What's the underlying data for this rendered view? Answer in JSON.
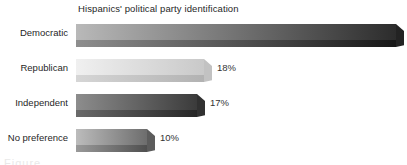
{
  "chart_data": {
    "type": "bar",
    "orientation": "horizontal",
    "title": "Hispanics' political party identification",
    "xlabel": "",
    "ylabel": "",
    "categories": [
      "Democratic",
      "Republican",
      "Independent",
      "No preference"
    ],
    "values": [
      45,
      18,
      17,
      10
    ],
    "value_labels": [
      "45%",
      "18%",
      "17%",
      "10%"
    ],
    "xlim": [
      0,
      45
    ],
    "grid": false,
    "legend": "none",
    "style": "3d-grayscale-gradient-bars",
    "bar_colors": [
      {
        "light": "#b9b9b9",
        "dark": "#2c2c2c",
        "shadow_light": "#8e8e8e",
        "shadow_dark": "#171717",
        "cap": "#232323"
      },
      {
        "light": "#f0f0f0",
        "dark": "#c9c9c9",
        "shadow_light": "#d6d6d6",
        "shadow_dark": "#b2b2b2",
        "cap": "#c2c2c2"
      },
      {
        "light": "#8d8d8d",
        "dark": "#3b3b3b",
        "shadow_light": "#6a6a6a",
        "shadow_dark": "#262626",
        "cap": "#313131"
      },
      {
        "light": "#bcbcbc",
        "dark": "#6d6d6d",
        "shadow_light": "#9a9a9a",
        "shadow_dark": "#4f4f4f",
        "cap": "#5c5c5c"
      }
    ]
  },
  "caption_fragment": "Figure"
}
